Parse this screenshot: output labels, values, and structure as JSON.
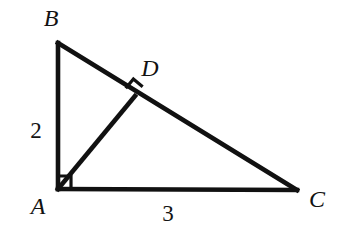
{
  "figure": {
    "type": "geometry-diagram",
    "width": 349,
    "height": 241,
    "background_color": "#ffffff",
    "stroke_color": "#111111",
    "stroke_width": 4
  },
  "points": {
    "A": {
      "label": "A",
      "x": 58,
      "y": 189,
      "label_x": 38,
      "label_y": 206
    },
    "B": {
      "label": "B",
      "x": 58,
      "y": 43,
      "label_x": 51,
      "label_y": 18
    },
    "C": {
      "label": "C",
      "x": 297,
      "y": 190,
      "label_x": 317,
      "label_y": 199
    },
    "D": {
      "label": "D",
      "x": 135,
      "y": 96,
      "label_x": 150,
      "label_y": 68
    }
  },
  "segments": [
    {
      "name": "AB",
      "from": "A",
      "to": "B"
    },
    {
      "name": "AC",
      "from": "A",
      "to": "C"
    },
    {
      "name": "BC",
      "from": "B",
      "to": "C"
    },
    {
      "name": "AD",
      "from": "A",
      "to": "D"
    }
  ],
  "side_labels": [
    {
      "name": "AB-length",
      "text": "2",
      "x": 36,
      "y": 130
    },
    {
      "name": "AC-length",
      "text": "3",
      "x": 168,
      "y": 213
    }
  ],
  "right_angle_marks": [
    {
      "name": "right-angle-at-A",
      "at": "A",
      "size": 13,
      "rotation": 0
    },
    {
      "name": "right-angle-at-D",
      "at": "D",
      "size": 12,
      "rotation": -50
    }
  ]
}
